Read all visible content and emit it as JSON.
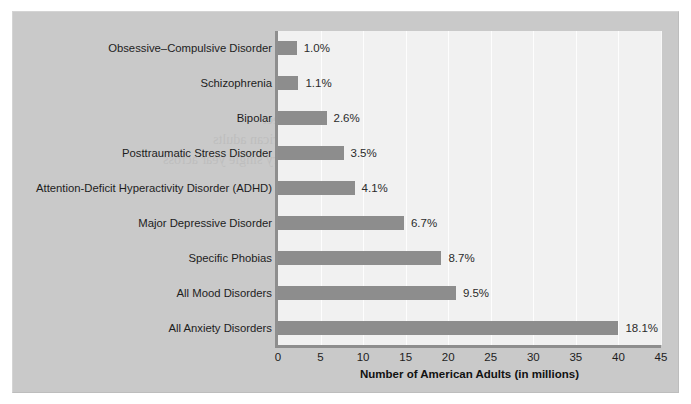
{
  "figure": {
    "background_color": "#c9c9c9",
    "plot_background_color": "#f1f1f1",
    "bar_color": "#8d8d8d",
    "grid_color": "#ffffff"
  },
  "chart_data": {
    "type": "bar",
    "orientation": "horizontal",
    "title": "",
    "xlabel": "Number of American Adults (in millions)",
    "ylabel": "",
    "xlim": [
      0,
      45
    ],
    "xticks": [
      0,
      5,
      10,
      15,
      20,
      25,
      30,
      35,
      40,
      45
    ],
    "xtick_labels": [
      "0",
      "5",
      "10",
      "15",
      "20",
      "25",
      "30",
      "35",
      "40",
      "45"
    ],
    "grid": true,
    "grid_axis": "x",
    "legend": false,
    "categories": [
      "Obsessive–Compulsive Disorder",
      "Schizophrenia",
      "Bipolar",
      "Posttraumatic Stress Disorder",
      "Attention-Deficit Hyperactivity Disorder (ADHD)",
      "Major Depressive Disorder",
      "Specific Phobias",
      "All Mood Disorders",
      "All Anxiety Disorders"
    ],
    "values": [
      2.2,
      2.4,
      5.7,
      7.7,
      9.0,
      14.8,
      19.2,
      20.9,
      40.0
    ],
    "value_unit": "millions of American adults",
    "data_labels": [
      "1.0%",
      "1.1%",
      "2.6%",
      "3.5%",
      "4.1%",
      "6.7%",
      "8.7%",
      "9.5%",
      "18.1%"
    ],
    "data_label_meaning": "percent of U.S. adult population",
    "bars": [
      {
        "category": "Obsessive–Compulsive Disorder",
        "millions": 2.2,
        "percent_label": "1.0%"
      },
      {
        "category": "Schizophrenia",
        "millions": 2.4,
        "percent_label": "1.1%"
      },
      {
        "category": "Bipolar",
        "millions": 5.7,
        "percent_label": "2.6%"
      },
      {
        "category": "Posttraumatic Stress Disorder",
        "millions": 7.7,
        "percent_label": "3.5%"
      },
      {
        "category": "Attention-Deficit Hyperactivity Disorder (ADHD)",
        "millions": 9.0,
        "percent_label": "4.1%"
      },
      {
        "category": "Major Depressive Disorder",
        "millions": 14.8,
        "percent_label": "6.7%"
      },
      {
        "category": "Specific Phobias",
        "millions": 19.2,
        "percent_label": "8.7%"
      },
      {
        "category": "All Mood Disorders",
        "millions": 20.9,
        "percent_label": "9.5%"
      },
      {
        "category": "All Anxiety Disorders",
        "millions": 40.0,
        "percent_label": "18.1%"
      }
    ]
  },
  "background_ghost_text": [
    "the prevalence of mental disorders among",
    "adults in the United States each year",
    "disorders are more common than",
    "many people realize and affect",
    "millions of American adults",
    "every single year across",
    "all demographic groups",
    "and age ranges today",
    "American Psychiatric",
    "Mind and Body Connection"
  ]
}
